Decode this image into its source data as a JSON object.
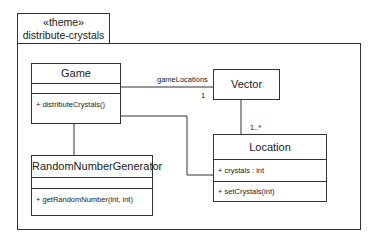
{
  "package": {
    "stereotype": "«theme»",
    "name": "distribute-crystals"
  },
  "classes": {
    "game": {
      "name": "Game",
      "attributes": [],
      "operations": [
        "+ distributeCrystals()"
      ]
    },
    "vector": {
      "name": "Vector"
    },
    "location": {
      "name": "Location",
      "attributes": [
        "+ crystals : int"
      ],
      "operations": [
        "+ setCrystals(int)"
      ]
    },
    "rng": {
      "name": "RandomNumberGenerator",
      "attributes": [],
      "operations": [
        "+ getRandomNumber(int, int)"
      ]
    }
  },
  "associations": {
    "game_vector": {
      "role": "gameLocations",
      "multiplicity_vector_end": "1"
    },
    "vector_location": {
      "multiplicity_location_end": "1..*"
    },
    "game_location": {},
    "game_rng": {}
  },
  "colors": {
    "line": "#333333",
    "background": "#ffffff"
  }
}
